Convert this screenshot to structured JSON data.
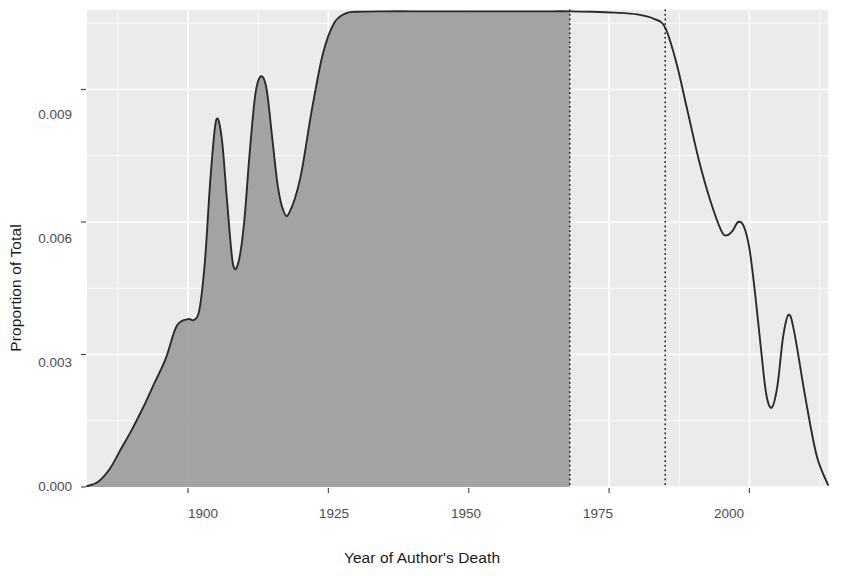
{
  "chart_data": {
    "type": "area",
    "title": "",
    "subtitle": "",
    "xlabel": "Year of Author's Death",
    "ylabel": "Proportion of Total",
    "xlim": [
      1882,
      2014
    ],
    "ylim": [
      0.0,
      0.0108
    ],
    "xticks": [
      1900,
      1925,
      1950,
      1975,
      2000
    ],
    "xticklabels": [
      "1900",
      "1925",
      "1950",
      "1975",
      "2000"
    ],
    "yticks": [
      0.0,
      0.003,
      0.006,
      0.009
    ],
    "yticklabels": [
      "0.000",
      "0.003",
      "0.006",
      "0.009"
    ],
    "grid": true,
    "legend": null,
    "panel_background": "#ebebeb",
    "grid_color": "#ffffff",
    "line_color": "#2b2b2b",
    "fill_color": "#9c9c9c",
    "annotation_lines": [
      {
        "label": "public-domain cutoff",
        "x": 1968,
        "style": "dotted",
        "color": "#2b2b2b"
      },
      {
        "label": "copyright extension",
        "x": 1985,
        "style": "dotted",
        "color": "#2b2b2b"
      }
    ],
    "fill_x_range": [
      1882,
      1968
    ],
    "series": [
      {
        "name": "density",
        "x": [
          1882,
          1884,
          1886,
          1888,
          1890,
          1892,
          1894,
          1896,
          1898,
          1900,
          1901,
          1902,
          1903,
          1904,
          1905,
          1906,
          1907,
          1908,
          1909,
          1910,
          1911,
          1912,
          1913,
          1914,
          1915,
          1916,
          1917,
          1918,
          1920,
          1922,
          1924,
          1926,
          1928,
          1930,
          1935,
          1940,
          1945,
          1950,
          1955,
          1960,
          1965,
          1968,
          1972,
          1976,
          1980,
          1983,
          1985,
          1987,
          1989,
          1991,
          1993,
          1995,
          1996,
          1997,
          1998,
          1999,
          2000,
          2001,
          2002,
          2003,
          2004,
          2005,
          2006,
          2007,
          2008,
          2010,
          2012,
          2014
        ],
        "y": [
          2e-05,
          0.00012,
          0.0004,
          0.00085,
          0.0013,
          0.0018,
          0.00235,
          0.0029,
          0.00365,
          0.0038,
          0.00378,
          0.004,
          0.0051,
          0.007,
          0.0083,
          0.0079,
          0.0064,
          0.00505,
          0.0051,
          0.006,
          0.0076,
          0.0089,
          0.0093,
          0.009,
          0.0079,
          0.0068,
          0.00625,
          0.0062,
          0.007,
          0.0085,
          0.0098,
          0.0105,
          0.01072,
          0.01076,
          0.01077,
          0.01077,
          0.01077,
          0.01077,
          0.01077,
          0.01077,
          0.01077,
          0.01077,
          0.01076,
          0.01074,
          0.0107,
          0.0106,
          0.0104,
          0.0096,
          0.0085,
          0.0074,
          0.0065,
          0.0058,
          0.0057,
          0.0058,
          0.006,
          0.0059,
          0.0054,
          0.0044,
          0.0032,
          0.0021,
          0.0018,
          0.0023,
          0.0034,
          0.0039,
          0.0035,
          0.002,
          0.0007,
          5e-05
        ]
      }
    ]
  },
  "axes": {
    "x_title": "Year of Author's Death",
    "y_title": "Proportion of Total",
    "x_tick_labels": [
      "1900",
      "1925",
      "1950",
      "1975",
      "2000"
    ],
    "y_tick_labels": [
      "0.000",
      "0.003",
      "0.006",
      "0.009"
    ]
  }
}
